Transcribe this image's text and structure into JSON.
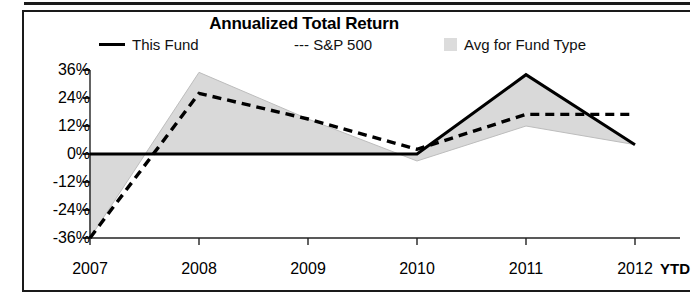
{
  "chart_data": {
    "type": "line",
    "title": "Annualized Total Return",
    "xlabel": "",
    "ylabel": "",
    "categories": [
      "2007",
      "2008",
      "2009",
      "2010",
      "2011",
      "2012"
    ],
    "x_note": "YTD",
    "ylim": [
      -36,
      36
    ],
    "yticks": [
      36,
      24,
      12,
      0,
      -12,
      -24,
      -36
    ],
    "ytick_labels": [
      "36%",
      "24%",
      "12%",
      "0%",
      "-12%",
      "-24%",
      "-36%"
    ],
    "grid": false,
    "legend_position": "top",
    "series": [
      {
        "name": "This Fund",
        "style": "solid",
        "values": [
          0,
          0,
          0,
          0,
          34,
          4
        ]
      },
      {
        "name": "S&P 500",
        "style": "dashed",
        "values": [
          -36,
          26,
          15,
          2,
          17,
          17
        ]
      },
      {
        "name": "Avg for Fund Type",
        "style": "shaded",
        "values": [
          -36,
          35,
          15,
          -3,
          12,
          4
        ]
      }
    ]
  },
  "legend": {
    "this_fund": "This Fund",
    "sp500": "--- S&P 500",
    "avg_fund_type": "Avg for Fund Type"
  },
  "colors": {
    "line": "#000000",
    "shaded_fill": "#d9d9d9",
    "shaded_edge": "#bdbdbd",
    "axis": "#222222",
    "frame": "#1a1a1a"
  }
}
